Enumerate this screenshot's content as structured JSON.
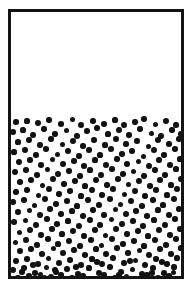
{
  "figure": {
    "canvas": {
      "width": 192,
      "height": 289,
      "background_color": "#ffffff"
    }
  },
  "container": {
    "name": "container-vessel",
    "shape": "rectangle",
    "left": 8,
    "top": 9,
    "width": 176,
    "height": 270,
    "border_width": 3,
    "border_color": "#141414",
    "interior_color": "#ffffff"
  },
  "fill": {
    "label": "particle fill level",
    "fill_line_y": 117,
    "fill_fraction_percent": 61,
    "empty_fraction_percent": 39,
    "empty_region_color": "#ffffff",
    "particle_region_color": "#ffffff"
  },
  "particles": {
    "count": 274,
    "color": "#111111",
    "shape": "circle",
    "diameter_px": 5.6,
    "diameter_min_px": 4.6,
    "diameter_max_px": 6.4,
    "distribution": "random-uniform",
    "positions": [
      [
        5,
        5,
        5.6
      ],
      [
        16,
        4,
        5.2
      ],
      [
        27,
        6,
        5.8
      ],
      [
        38,
        3,
        5.4
      ],
      [
        50,
        7,
        5.6
      ],
      [
        61,
        2,
        5.0
      ],
      [
        70,
        8,
        5.8
      ],
      [
        82,
        4,
        5.4
      ],
      [
        93,
        7,
        5.6
      ],
      [
        104,
        3,
        5.2
      ],
      [
        113,
        8,
        5.8
      ],
      [
        124,
        5,
        5.4
      ],
      [
        133,
        2,
        5.6
      ],
      [
        144,
        7,
        5.0
      ],
      [
        155,
        4,
        5.8
      ],
      [
        165,
        8,
        5.4
      ],
      [
        2,
        15,
        5.6
      ],
      [
        12,
        13,
        5.2
      ],
      [
        22,
        18,
        5.8
      ],
      [
        33,
        12,
        5.4
      ],
      [
        44,
        17,
        5.6
      ],
      [
        55,
        13,
        5.0
      ],
      [
        66,
        19,
        5.8
      ],
      [
        76,
        14,
        5.4
      ],
      [
        86,
        11,
        5.6
      ],
      [
        97,
        17,
        5.2
      ],
      [
        108,
        13,
        5.8
      ],
      [
        118,
        18,
        5.4
      ],
      [
        129,
        12,
        5.6
      ],
      [
        140,
        16,
        5.0
      ],
      [
        150,
        19,
        5.8
      ],
      [
        161,
        13,
        5.4
      ],
      [
        170,
        17,
        5.6
      ],
      [
        7,
        25,
        5.2
      ],
      [
        18,
        23,
        5.8
      ],
      [
        29,
        28,
        5.4
      ],
      [
        40,
        22,
        5.6
      ],
      [
        51,
        27,
        5.0
      ],
      [
        62,
        24,
        5.8
      ],
      [
        72,
        29,
        5.4
      ],
      [
        83,
        23,
        5.6
      ],
      [
        94,
        28,
        5.2
      ],
      [
        105,
        22,
        5.8
      ],
      [
        115,
        27,
        5.4
      ],
      [
        126,
        24,
        5.6
      ],
      [
        137,
        29,
        5.0
      ],
      [
        147,
        23,
        5.8
      ],
      [
        158,
        27,
        5.4
      ],
      [
        168,
        22,
        5.6
      ],
      [
        3,
        35,
        5.2
      ],
      [
        14,
        33,
        5.8
      ],
      [
        25,
        38,
        5.4
      ],
      [
        35,
        32,
        5.6
      ],
      [
        46,
        37,
        5.0
      ],
      [
        57,
        34,
        5.8
      ],
      [
        68,
        39,
        5.4
      ],
      [
        78,
        33,
        5.6
      ],
      [
        89,
        38,
        5.2
      ],
      [
        100,
        32,
        5.8
      ],
      [
        111,
        37,
        5.4
      ],
      [
        121,
        34,
        5.6
      ],
      [
        132,
        39,
        5.0
      ],
      [
        143,
        33,
        5.8
      ],
      [
        153,
        38,
        5.4
      ],
      [
        164,
        32,
        5.6
      ],
      [
        173,
        37,
        5.2
      ],
      [
        8,
        45,
        5.8
      ],
      [
        19,
        43,
        5.4
      ],
      [
        30,
        48,
        5.6
      ],
      [
        41,
        42,
        5.0
      ],
      [
        52,
        47,
        5.8
      ],
      [
        63,
        44,
        5.4
      ],
      [
        73,
        49,
        5.6
      ],
      [
        84,
        43,
        5.2
      ],
      [
        95,
        48,
        5.8
      ],
      [
        106,
        42,
        5.4
      ],
      [
        116,
        47,
        5.6
      ],
      [
        127,
        44,
        5.0
      ],
      [
        138,
        49,
        5.8
      ],
      [
        148,
        43,
        5.4
      ],
      [
        159,
        48,
        5.6
      ],
      [
        169,
        42,
        5.2
      ],
      [
        4,
        55,
        5.8
      ],
      [
        15,
        53,
        5.4
      ],
      [
        26,
        58,
        5.6
      ],
      [
        36,
        52,
        5.0
      ],
      [
        47,
        57,
        5.8
      ],
      [
        58,
        54,
        5.4
      ],
      [
        69,
        59,
        5.6
      ],
      [
        79,
        53,
        5.2
      ],
      [
        90,
        58,
        5.8
      ],
      [
        101,
        52,
        5.4
      ],
      [
        112,
        57,
        5.6
      ],
      [
        122,
        54,
        5.0
      ],
      [
        133,
        59,
        5.8
      ],
      [
        144,
        53,
        5.4
      ],
      [
        154,
        58,
        5.6
      ],
      [
        165,
        52,
        5.2
      ],
      [
        174,
        57,
        5.8
      ],
      [
        9,
        65,
        5.4
      ],
      [
        20,
        63,
        5.6
      ],
      [
        31,
        68,
        5.0
      ],
      [
        42,
        62,
        5.8
      ],
      [
        53,
        67,
        5.4
      ],
      [
        64,
        64,
        5.6
      ],
      [
        74,
        69,
        5.2
      ],
      [
        85,
        63,
        5.8
      ],
      [
        96,
        68,
        5.4
      ],
      [
        107,
        62,
        5.6
      ],
      [
        117,
        67,
        5.0
      ],
      [
        128,
        64,
        5.8
      ],
      [
        139,
        69,
        5.4
      ],
      [
        149,
        63,
        5.6
      ],
      [
        160,
        68,
        5.2
      ],
      [
        170,
        62,
        5.8
      ],
      [
        5,
        75,
        5.4
      ],
      [
        16,
        73,
        5.6
      ],
      [
        27,
        78,
        5.0
      ],
      [
        38,
        72,
        5.8
      ],
      [
        48,
        77,
        5.4
      ],
      [
        59,
        74,
        5.6
      ],
      [
        70,
        79,
        5.2
      ],
      [
        81,
        73,
        5.8
      ],
      [
        91,
        78,
        5.4
      ],
      [
        102,
        72,
        5.6
      ],
      [
        113,
        77,
        5.0
      ],
      [
        124,
        74,
        5.8
      ],
      [
        134,
        79,
        5.4
      ],
      [
        145,
        73,
        5.6
      ],
      [
        156,
        78,
        5.2
      ],
      [
        166,
        72,
        5.8
      ],
      [
        2,
        85,
        5.4
      ],
      [
        13,
        83,
        5.6
      ],
      [
        23,
        88,
        5.0
      ],
      [
        34,
        82,
        5.8
      ],
      [
        45,
        87,
        5.4
      ],
      [
        56,
        84,
        5.6
      ],
      [
        66,
        89,
        5.2
      ],
      [
        77,
        83,
        5.8
      ],
      [
        88,
        88,
        5.4
      ],
      [
        99,
        82,
        5.6
      ],
      [
        109,
        87,
        5.0
      ],
      [
        120,
        84,
        5.8
      ],
      [
        131,
        89,
        5.4
      ],
      [
        142,
        83,
        5.6
      ],
      [
        152,
        88,
        5.2
      ],
      [
        163,
        82,
        5.8
      ],
      [
        173,
        87,
        5.4
      ],
      [
        7,
        95,
        5.6
      ],
      [
        18,
        93,
        5.0
      ],
      [
        29,
        98,
        5.8
      ],
      [
        39,
        92,
        5.4
      ],
      [
        50,
        97,
        5.6
      ],
      [
        61,
        94,
        5.2
      ],
      [
        72,
        99,
        5.8
      ],
      [
        82,
        93,
        5.4
      ],
      [
        93,
        98,
        5.6
      ],
      [
        104,
        92,
        5.0
      ],
      [
        115,
        97,
        5.8
      ],
      [
        125,
        94,
        5.4
      ],
      [
        136,
        99,
        5.6
      ],
      [
        147,
        93,
        5.2
      ],
      [
        158,
        98,
        5.8
      ],
      [
        168,
        92,
        5.4
      ],
      [
        3,
        105,
        5.6
      ],
      [
        14,
        103,
        5.0
      ],
      [
        25,
        108,
        5.8
      ],
      [
        36,
        102,
        5.4
      ],
      [
        46,
        107,
        5.6
      ],
      [
        57,
        104,
        5.2
      ],
      [
        68,
        109,
        5.8
      ],
      [
        79,
        103,
        5.4
      ],
      [
        89,
        108,
        5.6
      ],
      [
        100,
        102,
        5.0
      ],
      [
        111,
        107,
        5.8
      ],
      [
        122,
        104,
        5.4
      ],
      [
        132,
        109,
        5.6
      ],
      [
        143,
        103,
        5.2
      ],
      [
        154,
        108,
        5.8
      ],
      [
        164,
        102,
        5.4
      ],
      [
        174,
        107,
        5.6
      ],
      [
        8,
        115,
        5.0
      ],
      [
        19,
        113,
        5.8
      ],
      [
        30,
        118,
        5.4
      ],
      [
        41,
        112,
        5.6
      ],
      [
        51,
        117,
        5.2
      ],
      [
        62,
        114,
        5.8
      ],
      [
        73,
        119,
        5.4
      ],
      [
        84,
        113,
        5.6
      ],
      [
        94,
        118,
        5.0
      ],
      [
        105,
        112,
        5.8
      ],
      [
        116,
        117,
        5.4
      ],
      [
        127,
        114,
        5.6
      ],
      [
        137,
        119,
        5.2
      ],
      [
        148,
        113,
        5.8
      ],
      [
        159,
        118,
        5.4
      ],
      [
        169,
        112,
        5.6
      ],
      [
        4,
        125,
        5.0
      ],
      [
        15,
        123,
        5.8
      ],
      [
        26,
        128,
        5.4
      ],
      [
        37,
        122,
        5.6
      ],
      [
        47,
        127,
        5.2
      ],
      [
        58,
        124,
        5.8
      ],
      [
        69,
        129,
        5.4
      ],
      [
        80,
        123,
        5.6
      ],
      [
        90,
        128,
        5.0
      ],
      [
        101,
        122,
        5.8
      ],
      [
        112,
        127,
        5.4
      ],
      [
        123,
        124,
        5.6
      ],
      [
        133,
        129,
        5.2
      ],
      [
        144,
        123,
        5.8
      ],
      [
        155,
        128,
        5.4
      ],
      [
        165,
        122,
        5.6
      ],
      [
        9,
        134,
        5.8
      ],
      [
        20,
        132,
        5.4
      ],
      [
        31,
        137,
        5.6
      ],
      [
        42,
        131,
        5.0
      ],
      [
        52,
        136,
        5.8
      ],
      [
        63,
        133,
        5.4
      ],
      [
        74,
        138,
        5.6
      ],
      [
        85,
        132,
        5.2
      ],
      [
        95,
        137,
        5.8
      ],
      [
        106,
        131,
        5.4
      ],
      [
        117,
        136,
        5.6
      ],
      [
        128,
        133,
        5.0
      ],
      [
        138,
        138,
        5.8
      ],
      [
        149,
        132,
        5.4
      ],
      [
        160,
        137,
        5.6
      ],
      [
        170,
        131,
        5.2
      ],
      [
        5,
        144,
        5.8
      ],
      [
        16,
        142,
        5.4
      ],
      [
        27,
        147,
        5.6
      ],
      [
        37,
        141,
        5.0
      ],
      [
        48,
        146,
        5.8
      ],
      [
        59,
        143,
        5.4
      ],
      [
        70,
        148,
        5.6
      ],
      [
        81,
        142,
        5.2
      ],
      [
        91,
        147,
        5.8
      ],
      [
        102,
        141,
        5.4
      ],
      [
        113,
        146,
        5.6
      ],
      [
        124,
        143,
        5.0
      ],
      [
        134,
        148,
        5.8
      ],
      [
        145,
        142,
        5.4
      ],
      [
        156,
        147,
        5.6
      ],
      [
        166,
        141,
        5.2
      ],
      [
        2,
        153,
        5.8
      ],
      [
        13,
        151,
        5.4
      ],
      [
        24,
        156,
        5.6
      ],
      [
        35,
        150,
        5.0
      ],
      [
        45,
        155,
        5.8
      ],
      [
        56,
        152,
        5.4
      ],
      [
        67,
        157,
        5.6
      ],
      [
        78,
        151,
        5.2
      ],
      [
        88,
        156,
        5.8
      ],
      [
        99,
        150,
        5.4
      ],
      [
        110,
        155,
        5.6
      ],
      [
        121,
        152,
        5.0
      ],
      [
        131,
        157,
        5.8
      ],
      [
        142,
        151,
        5.4
      ],
      [
        153,
        156,
        5.6
      ],
      [
        163,
        150,
        5.2
      ],
      [
        173,
        155,
        5.8
      ],
      [
        7,
        161,
        5.4
      ],
      [
        18,
        159,
        5.6
      ],
      [
        29,
        157,
        5.0
      ],
      [
        40,
        160,
        5.8
      ],
      [
        50,
        158,
        5.4
      ],
      [
        61,
        161,
        5.6
      ],
      [
        72,
        159,
        5.2
      ],
      [
        83,
        162,
        5.8
      ],
      [
        93,
        158,
        5.4
      ],
      [
        104,
        161,
        5.6
      ],
      [
        115,
        159,
        5.0
      ],
      [
        126,
        162,
        5.8
      ],
      [
        136,
        158,
        5.4
      ],
      [
        147,
        161,
        5.6
      ],
      [
        158,
        159,
        5.2
      ],
      [
        168,
        162,
        5.8
      ],
      [
        11,
        155,
        5.4
      ],
      [
        22,
        148,
        5.6
      ],
      [
        33,
        160,
        5.0
      ],
      [
        44,
        153,
        5.8
      ],
      [
        65,
        150,
        5.4
      ],
      [
        86,
        145,
        5.6
      ],
      [
        108,
        158,
        5.2
      ],
      [
        119,
        144,
        5.8
      ],
      [
        141,
        156,
        5.4
      ],
      [
        151,
        145,
        5.6
      ],
      [
        162,
        155,
        5.0
      ],
      [
        176,
        148,
        5.8
      ]
    ]
  }
}
